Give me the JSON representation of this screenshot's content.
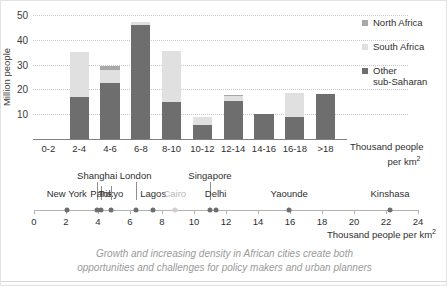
{
  "chart_data": {
    "type": "bar",
    "title": "",
    "subtitle": "",
    "xlabel": "Thousand people per km2",
    "ylabel": "Million people",
    "ylim": [
      0,
      50
    ],
    "yticks": [
      10,
      20,
      30,
      40,
      50
    ],
    "grid": true,
    "stacked": true,
    "legend_position": "right",
    "categories": [
      "0-2",
      "2-4",
      "4-6",
      "6-8",
      "8-10",
      "10-12",
      "12-14",
      "14-16",
      "16-18",
      ">18"
    ],
    "series": [
      {
        "name": "Other sub-Saharan",
        "color": "#6e6e6e",
        "values": [
          0,
          16.8,
          22.7,
          46.0,
          15.0,
          5.5,
          15.2,
          10.2,
          9.0,
          18.0
        ]
      },
      {
        "name": "South Africa",
        "color": "#e0e0e0",
        "values": [
          0,
          18.2,
          5.3,
          1.1,
          20.5,
          3.4,
          2.1,
          0,
          9.5,
          0
        ]
      },
      {
        "name": "North Africa",
        "color": "#a8a8a8",
        "values": [
          0,
          0,
          1.3,
          0,
          0,
          0,
          0.3,
          0,
          0,
          0
        ]
      }
    ],
    "totals": [
      0,
      35.0,
      29.3,
      47.1,
      35.5,
      8.9,
      17.6,
      10.2,
      18.5,
      18.0
    ]
  },
  "axis": {
    "y_label": "Million people",
    "y_ticks": [
      "50",
      "40",
      "30",
      "20",
      "10"
    ],
    "x_categories": [
      "0-2",
      "2-4",
      "4-6",
      "6-8",
      "8-10",
      "10-12",
      "12-14",
      "14-16",
      "16-18",
      ">18"
    ],
    "x_unit_line1": "Thousand people",
    "x_unit_line2": "per km",
    "x_unit_sup": "2"
  },
  "legend": {
    "items": [
      {
        "label": "North Africa",
        "label2": "",
        "color": "#a8a8a8",
        "key": "north"
      },
      {
        "label": "South Africa",
        "label2": "",
        "color": "#e0e0e0",
        "key": "south"
      },
      {
        "label": "Other",
        "label2": "sub-Saharan",
        "color": "#6e6e6e",
        "key": "other"
      }
    ]
  },
  "city_scale": {
    "unit_line1": "Thousand people per km",
    "unit_sup": "2",
    "ticks": [
      "0",
      "2",
      "4",
      "6",
      "8",
      "10",
      "12",
      "14",
      "16",
      "18",
      "20",
      "22",
      "24"
    ],
    "range": [
      0,
      24
    ],
    "cities": [
      {
        "name": "New York",
        "value": 2.05,
        "row": "bottom",
        "faded": false,
        "tick": false
      },
      {
        "name": "Shanghai",
        "value": 3.95,
        "row": "top",
        "faded": false,
        "tick": true
      },
      {
        "name": "Paris",
        "value": 4.2,
        "row": "bottom",
        "faded": false,
        "tick": true
      },
      {
        "name": "Tokyo",
        "value": 4.8,
        "row": "bottom",
        "faded": false,
        "tick": true
      },
      {
        "name": "London",
        "value": 6.35,
        "row": "top",
        "faded": false,
        "tick": true
      },
      {
        "name": "Lagos",
        "value": 7.45,
        "row": "bottom",
        "faded": false,
        "tick": false
      },
      {
        "name": "Cairo",
        "value": 8.8,
        "row": "bottom",
        "faded": true,
        "tick": false
      },
      {
        "name": "Singapore",
        "value": 11.0,
        "row": "top",
        "faded": false,
        "tick": true
      },
      {
        "name": "Delhi",
        "value": 11.35,
        "row": "bottom",
        "faded": false,
        "tick": false
      },
      {
        "name": "Yaounde",
        "value": 15.95,
        "row": "bottom",
        "faded": false,
        "tick": false
      },
      {
        "name": "Kinshasa",
        "value": 22.25,
        "row": "bottom",
        "faded": false,
        "tick": false
      }
    ]
  },
  "caption": {
    "line1": "Growth and increasing density in African cities create both",
    "line2": "opportunities and challenges for policy makers and urban planners"
  }
}
